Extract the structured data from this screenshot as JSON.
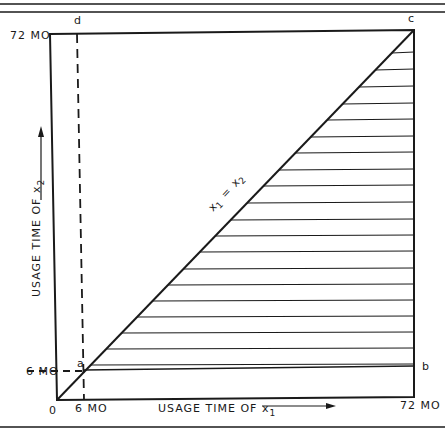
{
  "diagram": {
    "type": "region-diagram",
    "axes": {
      "x_label": "USAGE TIME OF x",
      "x_label_sub": "1",
      "y_label": "USAGE TIME OF x",
      "y_label_sub": "2",
      "origin": "0",
      "x_tick_6": "6 MO",
      "x_tick_72": "72 MO",
      "y_tick_6": "6 MO",
      "y_tick_72": "72 MO"
    },
    "points": {
      "a": "a",
      "b": "b",
      "c": "c",
      "d": "d"
    },
    "diagonal_label": {
      "left": "x",
      "left_sub": "1",
      "eq": "=",
      "right": "x",
      "right_sub": "2"
    },
    "hatch_lines_y": [
      53,
      70,
      87,
      104,
      120,
      137,
      153,
      170,
      186,
      203,
      220,
      236,
      252,
      269,
      285,
      301,
      317,
      333,
      349,
      365
    ],
    "colors": {
      "ink": "#1a1a1a",
      "background": "#ffffff"
    }
  }
}
